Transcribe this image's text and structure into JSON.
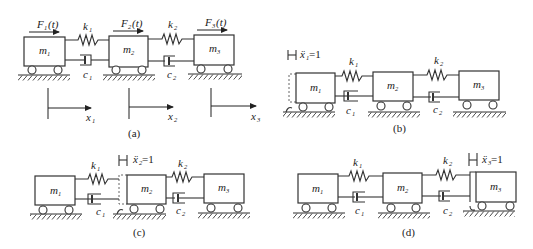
{
  "figure": {
    "panels": [
      {
        "id": "a",
        "caption": "(a)",
        "masses": [
          {
            "label": "m",
            "sub": "1"
          },
          {
            "label": "m",
            "sub": "2"
          },
          {
            "label": "m",
            "sub": "3"
          }
        ],
        "springs": [
          {
            "label": "k",
            "sub": "1"
          },
          {
            "label": "k",
            "sub": "2"
          }
        ],
        "dampers": [
          {
            "label": "c",
            "sub": "1"
          },
          {
            "label": "c",
            "sub": "2"
          }
        ],
        "forces": [
          {
            "label": "F",
            "sub": "1",
            "arg": "(t)"
          },
          {
            "label": "F",
            "sub": "2",
            "arg": "(t)"
          },
          {
            "label": "F",
            "sub": "3",
            "arg": "(t)"
          }
        ],
        "displacements": [
          {
            "label": "x",
            "sub": "1"
          },
          {
            "label": "x",
            "sub": "2"
          },
          {
            "label": "x",
            "sub": "3"
          }
        ]
      },
      {
        "id": "b",
        "caption": "(b)",
        "unit_accel": {
          "label": "ẍ",
          "sub": "1",
          "value": "=1"
        },
        "masses": [
          {
            "label": "m",
            "sub": "1"
          },
          {
            "label": "m",
            "sub": "2"
          },
          {
            "label": "m",
            "sub": "3"
          }
        ],
        "springs": [
          {
            "label": "k",
            "sub": "1"
          },
          {
            "label": "k",
            "sub": "2"
          }
        ],
        "dampers": [
          {
            "label": "c",
            "sub": "1"
          },
          {
            "label": "c",
            "sub": "2"
          }
        ]
      },
      {
        "id": "c",
        "caption": "(c)",
        "unit_accel": {
          "label": "ẍ",
          "sub": "2",
          "value": "=1"
        },
        "masses": [
          {
            "label": "m",
            "sub": "1"
          },
          {
            "label": "m",
            "sub": "2"
          },
          {
            "label": "m",
            "sub": "3"
          }
        ],
        "springs": [
          {
            "label": "k",
            "sub": "1"
          },
          {
            "label": "k",
            "sub": "2"
          }
        ],
        "dampers": [
          {
            "label": "c",
            "sub": "1"
          },
          {
            "label": "c",
            "sub": "2"
          }
        ]
      },
      {
        "id": "d",
        "caption": "(d)",
        "unit_accel": {
          "label": "ẍ",
          "sub": "3",
          "value": "=1"
        },
        "masses": [
          {
            "label": "m",
            "sub": "1"
          },
          {
            "label": "m",
            "sub": "2"
          },
          {
            "label": "m",
            "sub": "3"
          }
        ],
        "springs": [
          {
            "label": "k",
            "sub": "1"
          },
          {
            "label": "k",
            "sub": "2"
          }
        ],
        "dampers": [
          {
            "label": "c",
            "sub": "1"
          },
          {
            "label": "c",
            "sub": "2"
          }
        ]
      }
    ]
  }
}
